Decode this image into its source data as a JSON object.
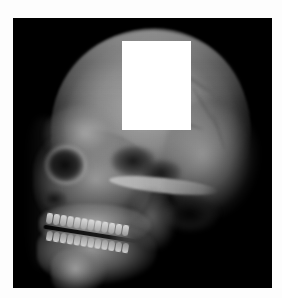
{
  "image": {
    "kind": "medical-radiograph",
    "modality": "X-ray",
    "view": "lateral cephalometric",
    "subject": "human skull",
    "orientation": "facing left, profile",
    "width_px": 282,
    "height_px": 298,
    "background_color": "#ffffff",
    "film_color": "#000000"
  },
  "film": {
    "left_px": 13,
    "top_px": 18,
    "width_px": 259,
    "height_px": 270
  },
  "redaction": {
    "label": "white rectangular occlusion patch",
    "color": "#ffffff",
    "left_px": 122,
    "top_px": 41,
    "width_px": 69,
    "height_px": 89,
    "covers_region": "frontal and anterior parietal cranial vault"
  },
  "anatomy": {
    "structures": [
      {
        "name": "cranial-vault",
        "tone": "mid-gray",
        "note": "large rounded dome, brightest along inner table"
      },
      {
        "name": "occipital-bone",
        "tone": "mid-gray",
        "note": "posterior rounded mass at right"
      },
      {
        "name": "frontal-bone",
        "tone": "light-gray",
        "note": "forehead, partly hidden by patch"
      },
      {
        "name": "orbital-socket",
        "tone": "dark",
        "note": "radiolucent eye socket"
      },
      {
        "name": "nasal-cavity",
        "tone": "dark",
        "note": "anterior airway notch"
      },
      {
        "name": "maxillary-sinus",
        "tone": "dark",
        "note": "air-filled cavity above upper teeth"
      },
      {
        "name": "sphenoid-sinus",
        "tone": "dark",
        "note": "central skull-base lucency"
      },
      {
        "name": "zygomatic-arch",
        "tone": "bright",
        "note": "thin bright horizontal bar"
      },
      {
        "name": "external-auditory-meatus",
        "tone": "dark",
        "note": "lucent region below temporal bone"
      },
      {
        "name": "maxilla",
        "tone": "bright",
        "note": "upper jaw with tooth row"
      },
      {
        "name": "mandible",
        "tone": "bright",
        "note": "lower jaw body and ramus"
      },
      {
        "name": "mandibular-ramus",
        "tone": "mid-gray",
        "note": "ascending branch toward joint"
      },
      {
        "name": "mental-protuberance",
        "tone": "bright",
        "note": "chin point"
      },
      {
        "name": "upper-teeth-row",
        "tone": "very-bright",
        "count": 12
      },
      {
        "name": "lower-teeth-row",
        "tone": "very-bright",
        "count": 12
      },
      {
        "name": "occlusal-gap",
        "tone": "black",
        "note": "dark line separating tooth rows"
      }
    ]
  },
  "palette": {
    "paper": "#fdfdfd",
    "film_black": "#000000",
    "bone_bright": "#d2d2d2",
    "bone_mid": "#8e8e8e",
    "bone_dim": "#4a4a4a",
    "cavity_dark": "#0a0a0a",
    "patch_white": "#ffffff"
  }
}
